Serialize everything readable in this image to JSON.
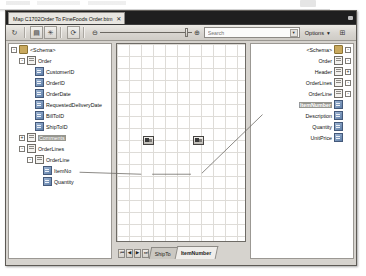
{
  "window": {
    "doc_tab": {
      "title": "Map C1702Order To FineFoods Order.btm",
      "close": "✕"
    }
  },
  "toolbar": {
    "buttons": [
      {
        "name": "validate-map-button",
        "glyph": "↻"
      },
      {
        "name": "test-map-button",
        "glyph": "▤"
      },
      {
        "name": "validate-instance-button",
        "glyph": "✳"
      },
      {
        "name": "refresh-button",
        "glyph": "⟳"
      }
    ],
    "zoom_out_glyph": "⊖",
    "zoom_in_glyph": "⊕",
    "zoom_level": "100",
    "search": {
      "placeholder": "Search",
      "value": "",
      "dropdown_glyph": "▾"
    },
    "options_label": "Options",
    "options_caret": "▾",
    "grid_button_glyph": "⊞"
  },
  "source_tree": {
    "title": "<Schema>",
    "items": [
      {
        "label": "<Schema>",
        "depth": 0,
        "expander": "-",
        "icon": "folder",
        "selected": false
      },
      {
        "label": "Order",
        "depth": 1,
        "expander": "-",
        "icon": "rec",
        "selected": false
      },
      {
        "label": "CustomerID",
        "depth": 2,
        "expander": "",
        "icon": "fld",
        "selected": false
      },
      {
        "label": "OrderID",
        "depth": 2,
        "expander": "",
        "icon": "fld",
        "selected": false
      },
      {
        "label": "OrderDate",
        "depth": 2,
        "expander": "",
        "icon": "fld",
        "selected": false
      },
      {
        "label": "RequestedDeliveryDate",
        "depth": 2,
        "expander": "",
        "icon": "fld",
        "selected": false
      },
      {
        "label": "BillToID",
        "depth": 2,
        "expander": "",
        "icon": "fld",
        "selected": false
      },
      {
        "label": "ShipToID",
        "depth": 2,
        "expander": "",
        "icon": "fld",
        "selected": false
      },
      {
        "label": "Comments",
        "depth": 1,
        "expander": "+",
        "icon": "rec",
        "selected": true
      },
      {
        "label": "OrderLines",
        "depth": 1,
        "expander": "-",
        "icon": "rec",
        "selected": false
      },
      {
        "label": "OrderLine",
        "depth": 2,
        "expander": "-",
        "icon": "rec",
        "selected": false
      },
      {
        "label": "ItemNo",
        "depth": 3,
        "expander": "",
        "icon": "fld",
        "selected": false
      },
      {
        "label": "Quantity",
        "depth": 3,
        "expander": "",
        "icon": "fld",
        "selected": false
      }
    ]
  },
  "target_tree": {
    "title": "<Schema>",
    "items": [
      {
        "label": "<Schema>",
        "expander": "-",
        "icon": "folder",
        "selected": false
      },
      {
        "label": "Order",
        "expander": "-",
        "icon": "rec",
        "selected": false
      },
      {
        "label": "Header",
        "expander": "+",
        "icon": "rec",
        "selected": false
      },
      {
        "label": "OrderLines",
        "expander": "-",
        "icon": "rec",
        "selected": false
      },
      {
        "label": "OrderLine",
        "expander": "-",
        "icon": "rec",
        "selected": false
      },
      {
        "label": "ItemNumber",
        "expander": "",
        "icon": "fld",
        "selected": true
      },
      {
        "label": "Description",
        "expander": "",
        "icon": "fld",
        "selected": false
      },
      {
        "label": "Quantity",
        "expander": "",
        "icon": "fld",
        "selected": false
      },
      {
        "label": "UnitPrice",
        "expander": "",
        "icon": "fld",
        "selected": false
      }
    ]
  },
  "canvas": {
    "nodes": [
      {
        "name": "functoid-node-1",
        "x": 26,
        "y": 92
      },
      {
        "name": "functoid-node-2",
        "x": 76,
        "y": 92
      }
    ],
    "grid_size": 12
  },
  "sheet_bar": {
    "nav": [
      {
        "name": "first-page-button",
        "glyph": "⏮"
      },
      {
        "name": "previous-page-button",
        "glyph": "◀"
      },
      {
        "name": "next-page-button",
        "glyph": "▶"
      },
      {
        "name": "last-page-button",
        "glyph": "⏭"
      }
    ],
    "tabs": [
      {
        "label": "ShipTo",
        "active": false
      },
      {
        "label": "ItemNumber",
        "active": true
      }
    ]
  },
  "colors": {
    "window_chrome": "#d6d3ce",
    "tabstrip": "#1f1f1f",
    "selection": "#96968f",
    "grid_line": "#dedcd8",
    "link": "#6e6b66"
  }
}
